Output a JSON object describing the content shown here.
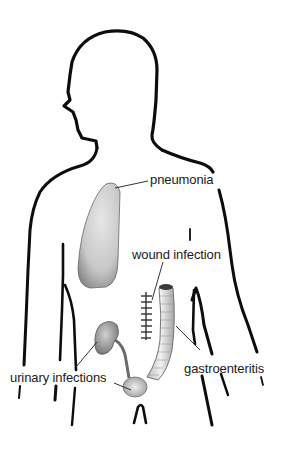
{
  "diagram": {
    "labels": {
      "pneumonia": "pneumonia",
      "wound_infection": "wound infection",
      "urinary_infections": "urinary infections",
      "gastroenteritis": "gastroenteritis"
    },
    "colors": {
      "outline": "#0d0d0d",
      "organ_fill": "#d4d4d4",
      "organ_shadow": "#8a8a8a",
      "text": "#1a1a1a",
      "background": "#ffffff"
    }
  }
}
